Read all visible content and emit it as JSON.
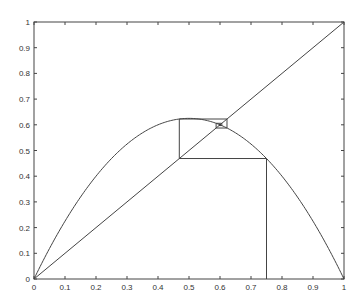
{
  "chart_data": {
    "type": "line",
    "title": "",
    "xlabel": "",
    "ylabel": "",
    "xlim": [
      0,
      1
    ],
    "ylim": [
      0,
      1
    ],
    "grid": false,
    "xticks": [
      "0",
      "0.1",
      "0.2",
      "0.3",
      "0.4",
      "0.5",
      "0.6",
      "0.7",
      "0.8",
      "0.9",
      "1"
    ],
    "yticks": [
      "0",
      "0.1",
      "0.2",
      "0.3",
      "0.4",
      "0.5",
      "0.6",
      "0.7",
      "0.8",
      "0.9",
      "1"
    ],
    "series": [
      {
        "name": "logistic map f(x)=2.5x(1-x)",
        "r": 2.5
      },
      {
        "name": "identity y=x"
      },
      {
        "name": "cobweb iteration",
        "x0": 0.75,
        "iterations": 12
      }
    ],
    "fixed_point": 0.6
  }
}
